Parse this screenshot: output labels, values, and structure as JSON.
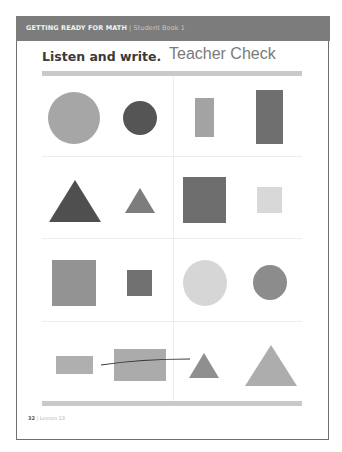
{
  "header": {
    "series": "GETTING READY FOR MATH",
    "separator": " | ",
    "book": "Student Book 1",
    "background": "#7c7c7c"
  },
  "instruction": "Listen and write.",
  "handwritten_note": "Teacher Check",
  "grid": {
    "rows": [
      {
        "left": [
          "large light circle",
          "small dark circle"
        ],
        "right": [
          "small light rectangle",
          "large dark rectangle"
        ]
      },
      {
        "left": [
          "large dark triangle",
          "small medium triangle"
        ],
        "right": [
          "large dark square",
          "small light square"
        ]
      },
      {
        "left": [
          "large medium square",
          "small dark square"
        ],
        "right": [
          "large light circle",
          "small medium circle"
        ]
      },
      {
        "left": [
          "small light rectangle",
          "large light rectangle"
        ],
        "right": [
          "small medium triangle",
          "large light triangle"
        ]
      }
    ]
  },
  "colors": {
    "dark": "#555555",
    "medium_dark": "#6e6e6e",
    "medium": "#8a8a8a",
    "light": "#a8a8a8",
    "very_light": "#d8d8d8",
    "pen_line": "#333333"
  },
  "footer": {
    "page_number": "32",
    "separator": " | ",
    "lesson": "Lesson 13"
  }
}
